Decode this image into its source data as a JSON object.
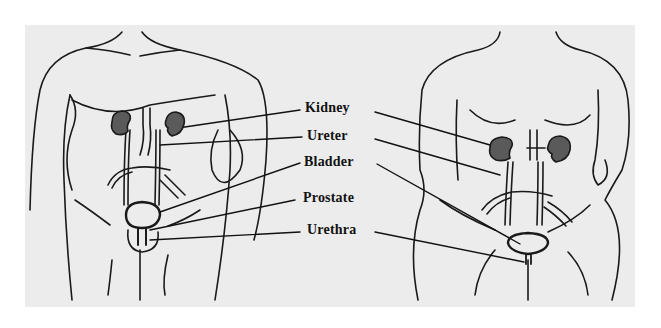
{
  "diagram": {
    "figures": [
      {
        "name": "male",
        "position": "left"
      },
      {
        "name": "female",
        "position": "right"
      }
    ],
    "labels": [
      {
        "id": "kidney",
        "text": "Kidney"
      },
      {
        "id": "ureter",
        "text": "Ureter"
      },
      {
        "id": "bladder",
        "text": "Bladder"
      },
      {
        "id": "prostate",
        "text": "Prostate"
      },
      {
        "id": "urethra",
        "text": "Urethra"
      }
    ],
    "colors": {
      "background": "#ececec",
      "outline": "#1a1a1a",
      "kidney_fill": "#5a5a5a"
    }
  }
}
